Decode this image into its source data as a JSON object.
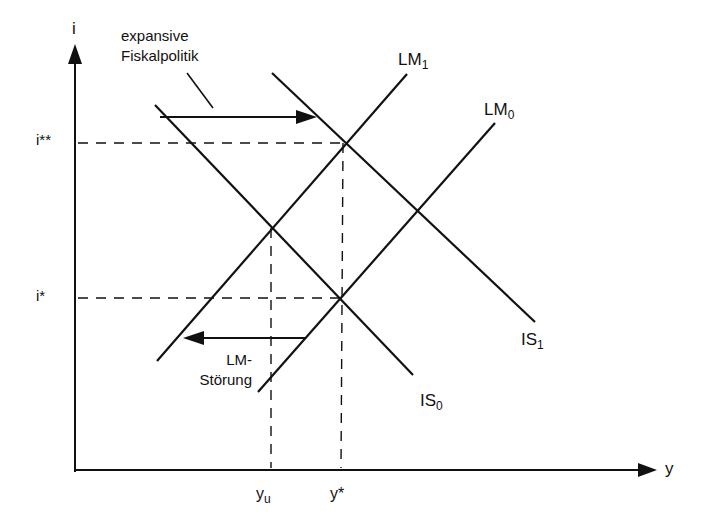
{
  "diagram": {
    "type": "IS-LM diagram",
    "axes": {
      "y_axis_label": "i",
      "x_axis_label": "y"
    },
    "interest_levels": {
      "high": "i**",
      "low": "i*"
    },
    "income_levels": {
      "underemployment": "y",
      "underemployment_sub": "u",
      "equilibrium": "y*"
    },
    "curves": {
      "is0": {
        "base": "IS",
        "sub": "0"
      },
      "is1": {
        "base": "IS",
        "sub": "1"
      },
      "lm0": {
        "base": "LM",
        "sub": "0"
      },
      "lm1": {
        "base": "LM",
        "sub": "1"
      }
    },
    "annotations": {
      "fiscal_line1": "expansive",
      "fiscal_line2": "Fiskalpolitik",
      "lm_shock_line1": "LM-",
      "lm_shock_line2": "Störung"
    },
    "colors": {
      "ink": "#111111",
      "background": "#ffffff"
    }
  }
}
